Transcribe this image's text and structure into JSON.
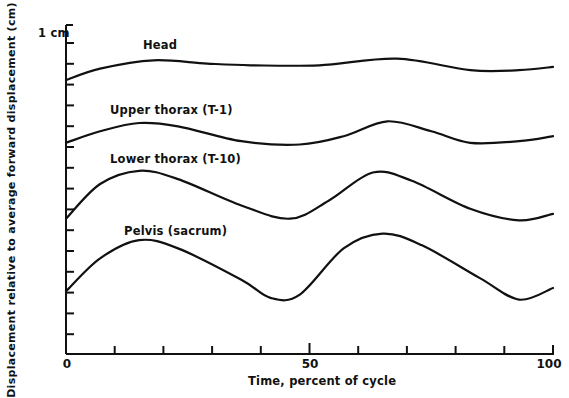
{
  "chart_data": {
    "type": "line",
    "title": "",
    "xlabel": "Time, percent of cycle",
    "ylabel": "Displacement relative to average forward displacement (cm)",
    "xlim": [
      0,
      100
    ],
    "x_tick_labels": [
      "0",
      "50",
      "100"
    ],
    "x_ticks": [
      0,
      10,
      20,
      30,
      40,
      50,
      60,
      70,
      80,
      90,
      100
    ],
    "y_scale_label": "1 cm",
    "grid": false,
    "legend": "inline labels above each curve",
    "units_note": "y values in cm relative to plot baseline (approximate, read from 1 cm scale bar)",
    "series": [
      {
        "name": "Head",
        "x": [
          0,
          7,
          18,
          29,
          38,
          52,
          68,
          83,
          93,
          100
        ],
        "y": [
          8.3,
          8.65,
          8.9,
          8.8,
          8.75,
          8.75,
          8.95,
          8.6,
          8.6,
          8.7
        ]
      },
      {
        "name": "Upper thorax (T-1)",
        "x": [
          0,
          7,
          15,
          23,
          36,
          48,
          57,
          66,
          75,
          83,
          93,
          100
        ],
        "y": [
          6.4,
          6.75,
          7.0,
          6.9,
          6.45,
          6.35,
          6.6,
          7.05,
          6.75,
          6.4,
          6.45,
          6.6
        ]
      },
      {
        "name": "Lower thorax (T-10)",
        "x": [
          0,
          7,
          15,
          23,
          36,
          46,
          54,
          63,
          71,
          83,
          93,
          100
        ],
        "y": [
          4.1,
          5.15,
          5.55,
          5.3,
          4.5,
          4.1,
          4.65,
          5.5,
          5.25,
          4.4,
          4.05,
          4.25
        ]
      },
      {
        "name": "Pelvis (sacrum)",
        "x": [
          0,
          7,
          15,
          23,
          36,
          42,
          48,
          57,
          65,
          73,
          85,
          93,
          100
        ],
        "y": [
          1.9,
          2.9,
          3.45,
          3.2,
          2.25,
          1.7,
          1.8,
          3.2,
          3.65,
          3.3,
          2.3,
          1.65,
          2.0
        ]
      }
    ]
  },
  "labels": {
    "scale": "1 cm",
    "head": "Head",
    "upper_thorax": "Upper thorax (T-1)",
    "lower_thorax": "Lower thorax (T-10)",
    "pelvis": "Pelvis (sacrum)",
    "x0": "0",
    "x50": "50",
    "x100": "100",
    "xlabel": "Time, percent of cycle",
    "ylabel": "Displacement relative to average forward displacement (cm)"
  }
}
